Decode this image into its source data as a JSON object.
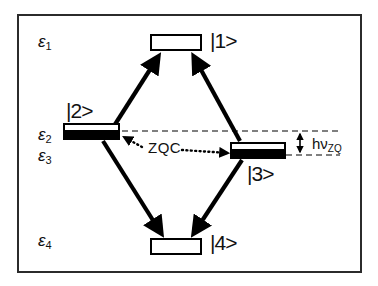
{
  "figure": {
    "type": "energy-level-diagram",
    "border_color": "#2b2b2b",
    "background": "#ffffff",
    "stroke_color": "#000000"
  },
  "energy_labels": [
    {
      "symbol": "ε",
      "sub": "1",
      "x": 38,
      "y": 33
    },
    {
      "symbol": "ε",
      "sub": "2",
      "x": 38,
      "y": 126
    },
    {
      "symbol": "ε",
      "sub": "3",
      "x": 38,
      "y": 147
    },
    {
      "symbol": "ε",
      "sub": "4",
      "x": 38,
      "y": 232
    }
  ],
  "states": [
    {
      "id": "1",
      "ket": "|1>",
      "fill": "empty",
      "box": {
        "x": 150,
        "y": 34,
        "w": 52,
        "h": 17
      },
      "label_pos": {
        "x": 210,
        "y": 30
      }
    },
    {
      "id": "2",
      "ket": "|2>",
      "fill": "half-filled",
      "box": {
        "x": 63,
        "y": 123,
        "w": 57,
        "h": 17
      },
      "label_pos": {
        "x": 66,
        "y": 100
      }
    },
    {
      "id": "3",
      "ket": "|3>",
      "fill": "half-filled",
      "box": {
        "x": 230,
        "y": 142,
        "w": 56,
        "h": 17
      },
      "label_pos": {
        "x": 247,
        "y": 163
      }
    },
    {
      "id": "4",
      "ket": "|4>",
      "fill": "empty",
      "box": {
        "x": 150,
        "y": 238,
        "w": 52,
        "h": 17
      },
      "label_pos": {
        "x": 210,
        "y": 232
      }
    }
  ],
  "annotations": {
    "zqc": {
      "text": "ZQC",
      "x": 148,
      "y": 146
    },
    "hv_zq": {
      "text": "hν",
      "sub": "ZQ",
      "x": 312,
      "y": 137
    }
  },
  "transitions": [
    {
      "from": "2",
      "to": "1",
      "style": "solid-arrow",
      "direction": "up"
    },
    {
      "from": "3",
      "to": "1",
      "style": "solid-arrow",
      "direction": "up"
    },
    {
      "from": "2",
      "to": "4",
      "style": "solid-arrow",
      "direction": "down"
    },
    {
      "from": "3",
      "to": "4",
      "style": "solid-arrow",
      "direction": "down"
    },
    {
      "from": "2",
      "to": "3",
      "style": "dotted-double-arrow",
      "label": "ZQC"
    }
  ],
  "guides": [
    {
      "type": "dashed-horizontal",
      "y": 131,
      "x1": 122,
      "x2": 340
    },
    {
      "type": "dashed-horizontal",
      "y": 155,
      "x1": 286,
      "x2": 340
    },
    {
      "type": "measure-bracket",
      "x": 300,
      "y1": 131,
      "y2": 155,
      "label": "hν_ZQ"
    }
  ]
}
